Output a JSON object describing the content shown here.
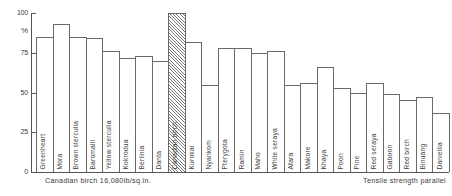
{
  "chart_data": {
    "type": "bar",
    "title": "",
    "xlabel": "",
    "ylabel": "%",
    "ylim": [
      0,
      100
    ],
    "yticks": [
      0,
      25,
      50,
      75,
      100
    ],
    "ytick_labels": [
      "0",
      "25",
      "50",
      "75",
      "100"
    ],
    "grid": false,
    "legend": "none",
    "categories": [
      "Greenheart",
      "Mora",
      "Brown sterculia",
      "Baromalli",
      "Yellow sterculia",
      "Kokrodua",
      "Berlinia",
      "Danta",
      "Canadian birch",
      "Kurokai",
      "Nyankom",
      "Pterygota",
      "Ramin",
      "Maho",
      "White seraya",
      "Afara",
      "Makore",
      "Khaya",
      "Poon",
      "Pine",
      "Red seraya",
      "Gaboon",
      "Red birch",
      "Binuang",
      "Daniellia"
    ],
    "values": [
      85,
      93,
      85,
      84,
      76,
      72,
      73,
      70,
      100,
      82,
      55,
      78,
      78,
      75,
      76,
      55,
      56,
      66,
      53,
      50,
      56,
      49,
      45,
      47,
      37
    ],
    "highlight_index": 8,
    "highlight_style": "hatched",
    "annotations": {
      "reference": "Canadian birch 16,080lb/sq.in.",
      "measure": "Tensile strength parallel"
    }
  },
  "axis": {
    "unit_symbol": "%"
  },
  "colors": {
    "bar_stroke": "#6a6a6a",
    "axis": "#555555",
    "text": "#3a3a3a",
    "hatch": "#7a7a7a"
  }
}
